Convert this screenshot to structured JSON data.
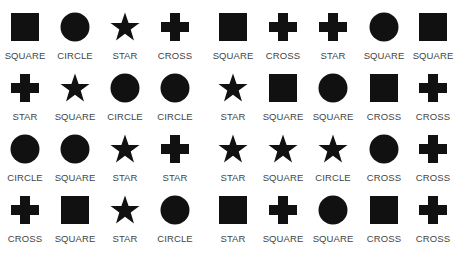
{
  "grid": {
    "columns": 9,
    "rows": 4,
    "shape_color": "#111111",
    "label_color": "#444444",
    "cells": [
      [
        {
          "shape": "square",
          "label": "SQUARE"
        },
        {
          "shape": "circle",
          "label": "CIRCLE"
        },
        {
          "shape": "star",
          "label": "STAR"
        },
        {
          "shape": "cross",
          "label": "CROSS"
        },
        {
          "shape": "square",
          "label": "SQUARE"
        },
        {
          "shape": "cross",
          "label": "CROSS"
        },
        {
          "shape": "cross",
          "label": "STAR"
        },
        {
          "shape": "circle",
          "label": "SQUARE"
        },
        {
          "shape": "square",
          "label": "SQUARE"
        }
      ],
      [
        {
          "shape": "cross",
          "label": "STAR"
        },
        {
          "shape": "star",
          "label": "SQUARE"
        },
        {
          "shape": "circle",
          "label": "CIRCLE"
        },
        {
          "shape": "circle",
          "label": "CIRCLE"
        },
        {
          "shape": "star",
          "label": "STAR"
        },
        {
          "shape": "square",
          "label": "SQUARE"
        },
        {
          "shape": "circle",
          "label": "SQUARE"
        },
        {
          "shape": "square",
          "label": "CROSS"
        },
        {
          "shape": "cross",
          "label": "CROSS"
        }
      ],
      [
        {
          "shape": "circle",
          "label": "CIRCLE"
        },
        {
          "shape": "circle",
          "label": "SQUARE"
        },
        {
          "shape": "star",
          "label": "STAR"
        },
        {
          "shape": "cross",
          "label": "STAR"
        },
        {
          "shape": "star",
          "label": "STAR"
        },
        {
          "shape": "star",
          "label": "SQUARE"
        },
        {
          "shape": "star",
          "label": "CIRCLE"
        },
        {
          "shape": "circle",
          "label": "CROSS"
        },
        {
          "shape": "cross",
          "label": "CROSS"
        }
      ],
      [
        {
          "shape": "cross",
          "label": "CROSS"
        },
        {
          "shape": "square",
          "label": "SQUARE"
        },
        {
          "shape": "star",
          "label": "STAR"
        },
        {
          "shape": "circle",
          "label": "CIRCLE"
        },
        {
          "shape": "square",
          "label": "STAR"
        },
        {
          "shape": "cross",
          "label": "SQUARE"
        },
        {
          "shape": "circle",
          "label": "SQUARE"
        },
        {
          "shape": "square",
          "label": "CROSS"
        },
        {
          "shape": "cross",
          "label": "CROSS"
        }
      ]
    ]
  }
}
